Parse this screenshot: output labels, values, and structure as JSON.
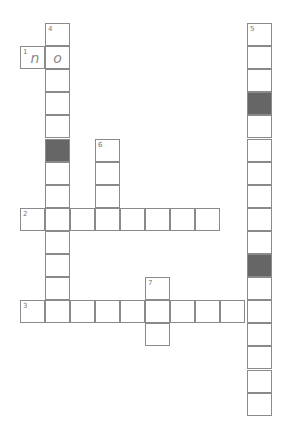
{
  "puzzle": {
    "cell_width": 25,
    "cell_height": 23.1,
    "origin_x": 20,
    "origin_y": 23,
    "col_x": [
      20,
      45,
      70,
      95,
      120,
      145,
      170,
      195,
      220,
      247
    ],
    "cells": [
      {
        "r": 0,
        "c": 1,
        "num": "4"
      },
      {
        "r": 1,
        "c": 0,
        "num": "1",
        "letter": "n"
      },
      {
        "r": 1,
        "c": 1,
        "letter": "o"
      },
      {
        "r": 2,
        "c": 1
      },
      {
        "r": 3,
        "c": 1
      },
      {
        "r": 4,
        "c": 1
      },
      {
        "r": 5,
        "c": 1,
        "shaded": true
      },
      {
        "r": 6,
        "c": 1
      },
      {
        "r": 7,
        "c": 1
      },
      {
        "r": 8,
        "c": 1
      },
      {
        "r": 9,
        "c": 1
      },
      {
        "r": 10,
        "c": 1
      },
      {
        "r": 11,
        "c": 1
      },
      {
        "r": 12,
        "c": 1
      },
      {
        "r": 5,
        "c": 3,
        "num": "6"
      },
      {
        "r": 6,
        "c": 3
      },
      {
        "r": 7,
        "c": 3
      },
      {
        "r": 8,
        "c": 0,
        "num": "2"
      },
      {
        "r": 8,
        "c": 2
      },
      {
        "r": 8,
        "c": 3
      },
      {
        "r": 8,
        "c": 4
      },
      {
        "r": 8,
        "c": 5
      },
      {
        "r": 8,
        "c": 6
      },
      {
        "r": 8,
        "c": 7
      },
      {
        "r": 11,
        "c": 5,
        "num": "7"
      },
      {
        "r": 13,
        "c": 5
      },
      {
        "r": 12,
        "c": 0,
        "num": "3"
      },
      {
        "r": 12,
        "c": 2
      },
      {
        "r": 12,
        "c": 3
      },
      {
        "r": 12,
        "c": 4
      },
      {
        "r": 12,
        "c": 5
      },
      {
        "r": 12,
        "c": 6
      },
      {
        "r": 12,
        "c": 7
      },
      {
        "r": 12,
        "c": 8
      },
      {
        "r": 0,
        "c": 9,
        "num": "5"
      },
      {
        "r": 1,
        "c": 9
      },
      {
        "r": 2,
        "c": 9
      },
      {
        "r": 3,
        "c": 9,
        "shaded": true
      },
      {
        "r": 4,
        "c": 9
      },
      {
        "r": 5,
        "c": 9
      },
      {
        "r": 6,
        "c": 9
      },
      {
        "r": 7,
        "c": 9
      },
      {
        "r": 8,
        "c": 9
      },
      {
        "r": 9,
        "c": 9
      },
      {
        "r": 10,
        "c": 9,
        "shaded": true
      },
      {
        "r": 11,
        "c": 9
      },
      {
        "r": 12,
        "c": 9
      },
      {
        "r": 13,
        "c": 9
      },
      {
        "r": 14,
        "c": 9
      },
      {
        "r": 15,
        "c": 9
      },
      {
        "r": 16,
        "c": 9
      }
    ]
  }
}
